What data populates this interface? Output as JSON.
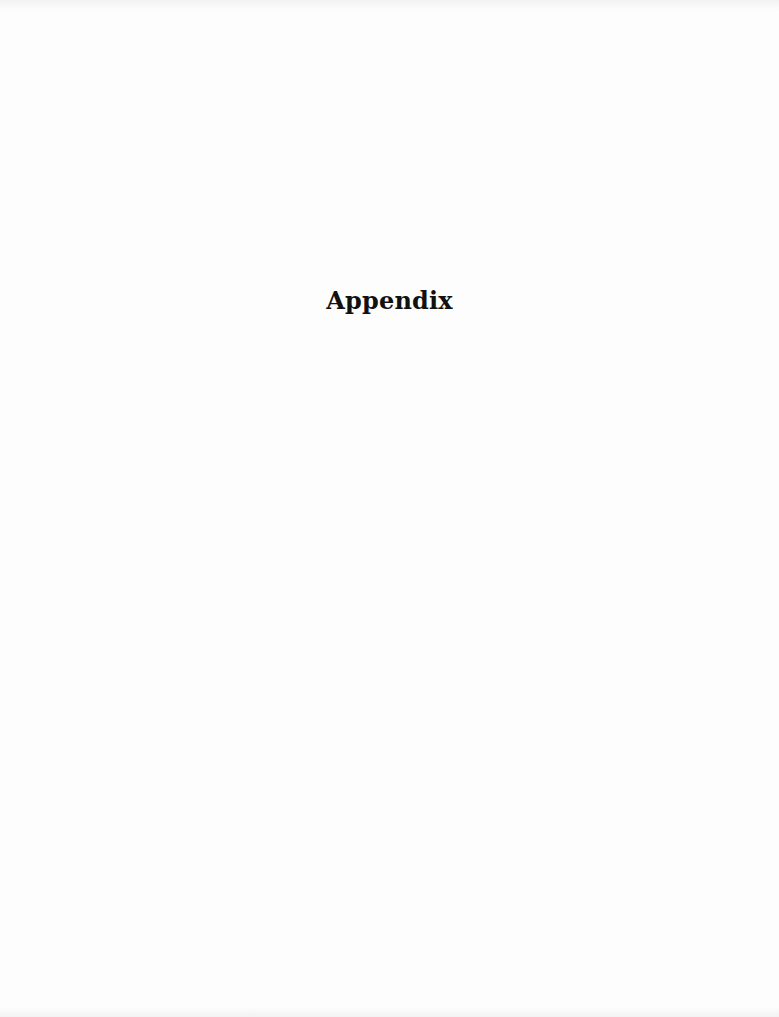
{
  "page": {
    "title": "Appendix",
    "background_color": "#fdfdfd",
    "text_color": "#111111"
  }
}
